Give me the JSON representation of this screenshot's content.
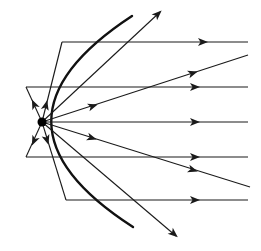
{
  "diagram": {
    "colors": {
      "line": "#1a1a1a",
      "mirror": "#111111",
      "background": "#ffffff"
    },
    "focus": {
      "x": 42,
      "y": 122,
      "r": 4.5
    },
    "mirror": {
      "path": "M132,16 Q-30,122 133,227",
      "stroke_width": 2.4
    },
    "reflected_rays": [
      {
        "name": "reflected-ray-1",
        "from": [
          62,
          42
        ],
        "to": [
          248,
          42
        ],
        "arrow_at": [
          203,
          42
        ]
      },
      {
        "name": "reflected-ray-2",
        "from": [
          26,
          87
        ],
        "to": [
          248,
          87
        ],
        "arrow_at": [
          195,
          87
        ]
      },
      {
        "name": "reflected-ray-3",
        "from": [
          42,
          122
        ],
        "to": [
          248,
          122
        ],
        "arrow_at": [
          195,
          122
        ]
      },
      {
        "name": "reflected-ray-4",
        "from": [
          26,
          157
        ],
        "to": [
          248,
          157
        ],
        "arrow_at": [
          195,
          157
        ]
      },
      {
        "name": "reflected-ray-5",
        "from": [
          66,
          200
        ],
        "to": [
          248,
          200
        ],
        "arrow_at": [
          195,
          200
        ]
      }
    ],
    "incident_rays": [
      {
        "name": "incident-ray-top",
        "from": [
          42,
          122
        ],
        "to": [
          62,
          42
        ],
        "arrow_at": [
          46,
          105
        ]
      },
      {
        "name": "incident-ray-upper",
        "from": [
          42,
          122
        ],
        "to": [
          26,
          87
        ],
        "arrow_at": [
          34,
          104
        ]
      },
      {
        "name": "incident-ray-lower",
        "from": [
          42,
          122
        ],
        "to": [
          26,
          157
        ],
        "arrow_at": [
          34,
          141
        ]
      },
      {
        "name": "incident-ray-bottom",
        "from": [
          42,
          122
        ],
        "to": [
          66,
          200
        ],
        "arrow_at": [
          47,
          140
        ]
      }
    ],
    "escaping_rays": [
      {
        "name": "escaping-ray-up",
        "from": [
          42,
          122
        ],
        "to": [
          160,
          12
        ],
        "arrow_at": [
          158,
          14
        ]
      },
      {
        "name": "escaping-ray-up-shallow",
        "from": [
          42,
          122
        ],
        "to": [
          248,
          55
        ],
        "arrow_at": [
          93,
          106
        ]
      },
      {
        "name": "escaping-ray-up-shallow-2",
        "from": [
          42,
          122
        ],
        "to": [
          248,
          55
        ],
        "arrow_at": [
          193,
          73
        ]
      },
      {
        "name": "escaping-ray-down-shallow",
        "from": [
          42,
          122
        ],
        "to": [
          250,
          187
        ],
        "arrow_at": [
          92,
          138
        ]
      },
      {
        "name": "escaping-ray-down-shallow-2",
        "from": [
          42,
          122
        ],
        "to": [
          250,
          187
        ],
        "arrow_at": [
          193,
          170
        ]
      },
      {
        "name": "escaping-ray-down",
        "from": [
          42,
          122
        ],
        "to": [
          176,
          236
        ],
        "arrow_at": [
          174,
          234
        ]
      }
    ]
  }
}
